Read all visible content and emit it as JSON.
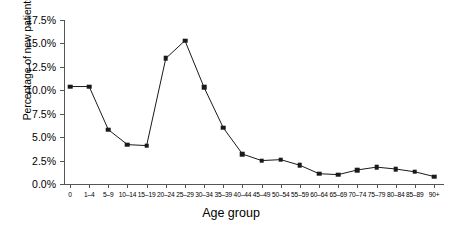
{
  "chart_data": {
    "type": "line",
    "title": "",
    "xlabel": "Age group",
    "ylabel": "Percentage of new patients",
    "categories": [
      "0",
      "1–4",
      "5–9",
      "10–14",
      "15–19",
      "20–24",
      "25–29",
      "30–34",
      "35–39",
      "40–44",
      "45–49",
      "50–54",
      "55–59",
      "60–64",
      "65–69",
      "70–74",
      "75–79",
      "80–84",
      "85–89",
      "90+"
    ],
    "values": [
      10.4,
      10.4,
      5.8,
      4.2,
      4.1,
      13.4,
      15.3,
      10.3,
      6.0,
      3.2,
      2.5,
      2.6,
      2.0,
      1.1,
      1.0,
      1.5,
      1.8,
      1.6,
      1.3,
      0.8
    ],
    "ylim": [
      0,
      17.5
    ],
    "ytick_values": [
      0,
      2.5,
      5.0,
      7.5,
      10.0,
      12.5,
      15.0,
      17.5
    ],
    "ytick_labels": [
      "0.0%",
      "2.5%",
      "5.0%",
      "7.5%",
      "10.0%",
      "12.5%",
      "15.0%",
      "17.5%"
    ],
    "grid": false,
    "legend": "none",
    "marker": "square",
    "line_color": "#1a1a1a",
    "marker_color": "#1a1a1a",
    "axis_color": "#555555",
    "background": "#ffffff"
  }
}
